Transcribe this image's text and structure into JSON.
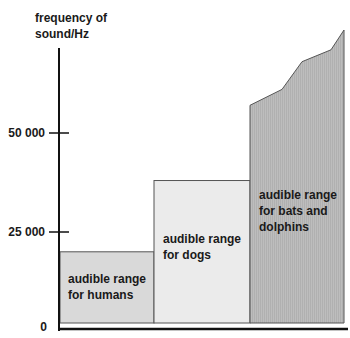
{
  "chart_data": {
    "type": "bar",
    "title": "",
    "ylabel_lines": [
      "frequency of",
      "sound/Hz"
    ],
    "xlabel": "",
    "ylim": [
      0,
      80000
    ],
    "yticks": [
      {
        "value": 0,
        "label": "0"
      },
      {
        "value": 25000,
        "label": "25 000"
      },
      {
        "value": 50000,
        "label": "50 000"
      }
    ],
    "grid": false,
    "series": [
      {
        "name": "humans",
        "label_lines": [
          "audible range",
          "for humans"
        ],
        "min": 0,
        "max": 20000,
        "color": "#d9d9d9"
      },
      {
        "name": "dogs",
        "label_lines": [
          "audible range",
          "for dogs"
        ],
        "min": 0,
        "max": 38000,
        "color": "#ebebeb"
      },
      {
        "name": "bats-and-dolphins",
        "label_lines": [
          "audible range",
          "for bats and",
          "dolphins"
        ],
        "min": 0,
        "max_profile": [
          57000,
          61000,
          68000,
          71000,
          76000
        ],
        "color": "#b9b9b9"
      }
    ]
  }
}
